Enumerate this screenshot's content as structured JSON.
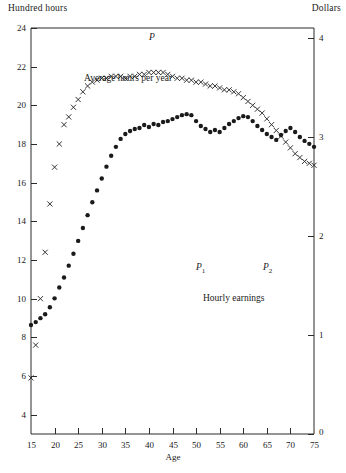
{
  "axes": {
    "left_axis_title": "Hundred hours",
    "right_axis_title": "Dollars",
    "x_axis_title": "Age",
    "origin_label": "0"
  },
  "annotations": {
    "hours_series_label": "Average hours per year",
    "earnings_series_label": "Hourly earnings",
    "peak_hours": "P",
    "peak_earnings_1": "P",
    "peak_earnings_1_sub": "1",
    "peak_earnings_2": "P",
    "peak_earnings_2_sub": "2"
  },
  "chart_data": {
    "type": "scatter",
    "title": "",
    "xlabel": "Age",
    "ylabel": "Hundred hours",
    "y2label": "Dollars",
    "xlim": [
      15,
      75
    ],
    "ylim": [
      3.0,
      24
    ],
    "y2lim": [
      0,
      4.1
    ],
    "grid": false,
    "legend": "inline-annotations",
    "xticks": [
      15,
      20,
      25,
      30,
      35,
      40,
      45,
      50,
      55,
      60,
      65,
      70,
      75
    ],
    "yticks": [
      4,
      6,
      8,
      10,
      12,
      14,
      16,
      18,
      20,
      22,
      24
    ],
    "y2ticks": [
      0,
      1,
      2,
      3,
      4
    ],
    "series": [
      {
        "name": "Average hours per year",
        "axis": "left",
        "marker": "x",
        "color": "#2a2a2a",
        "x": [
          15,
          16,
          17,
          18,
          19,
          20,
          21,
          22,
          23,
          24,
          25,
          26,
          27,
          28,
          29,
          30,
          31,
          32,
          33,
          34,
          35,
          36,
          37,
          38,
          39,
          40,
          41,
          42,
          43,
          44,
          45,
          46,
          47,
          48,
          49,
          50,
          51,
          52,
          53,
          54,
          55,
          56,
          57,
          58,
          59,
          60,
          61,
          62,
          63,
          64,
          65,
          66,
          67,
          68,
          69,
          70,
          71,
          72,
          73,
          74,
          75
        ],
        "values": [
          5.9,
          7.6,
          10.0,
          12.4,
          14.9,
          16.8,
          18.0,
          19.0,
          19.4,
          19.9,
          20.3,
          20.7,
          21.0,
          21.2,
          21.3,
          21.4,
          21.4,
          21.5,
          21.5,
          21.5,
          21.4,
          21.5,
          21.5,
          21.6,
          21.6,
          21.7,
          21.7,
          21.7,
          21.7,
          21.6,
          21.5,
          21.4,
          21.4,
          21.3,
          21.3,
          21.2,
          21.2,
          21.1,
          21.0,
          21.0,
          20.9,
          20.8,
          20.8,
          20.7,
          20.6,
          20.4,
          20.2,
          20.0,
          19.8,
          19.6,
          19.3,
          19.0,
          18.7,
          18.4,
          18.1,
          17.8,
          17.5,
          17.3,
          17.1,
          17.0,
          16.9
        ]
      },
      {
        "name": "Hourly earnings",
        "axis": "right",
        "marker": "o",
        "color": "#1a1a1a",
        "x": [
          15,
          16,
          17,
          18,
          19,
          20,
          21,
          22,
          23,
          24,
          25,
          26,
          27,
          28,
          29,
          30,
          31,
          32,
          33,
          34,
          35,
          36,
          37,
          38,
          39,
          40,
          41,
          42,
          43,
          44,
          45,
          46,
          47,
          48,
          49,
          50,
          51,
          52,
          53,
          54,
          55,
          56,
          57,
          58,
          59,
          60,
          61,
          62,
          63,
          64,
          65,
          66,
          67,
          68,
          69,
          70,
          71,
          72,
          73,
          74,
          75
        ],
        "values": [
          1.1,
          1.13,
          1.17,
          1.21,
          1.28,
          1.37,
          1.48,
          1.58,
          1.7,
          1.82,
          1.95,
          2.08,
          2.21,
          2.34,
          2.46,
          2.58,
          2.7,
          2.81,
          2.9,
          2.98,
          3.03,
          3.06,
          3.08,
          3.09,
          3.12,
          3.1,
          3.13,
          3.12,
          3.15,
          3.16,
          3.18,
          3.2,
          3.22,
          3.23,
          3.22,
          3.16,
          3.11,
          3.08,
          3.05,
          3.07,
          3.05,
          3.09,
          3.13,
          3.16,
          3.19,
          3.21,
          3.2,
          3.16,
          3.11,
          3.07,
          3.03,
          3.0,
          2.97,
          3.02,
          3.06,
          3.09,
          3.05,
          3.0,
          2.96,
          2.93,
          2.9
        ]
      }
    ]
  }
}
